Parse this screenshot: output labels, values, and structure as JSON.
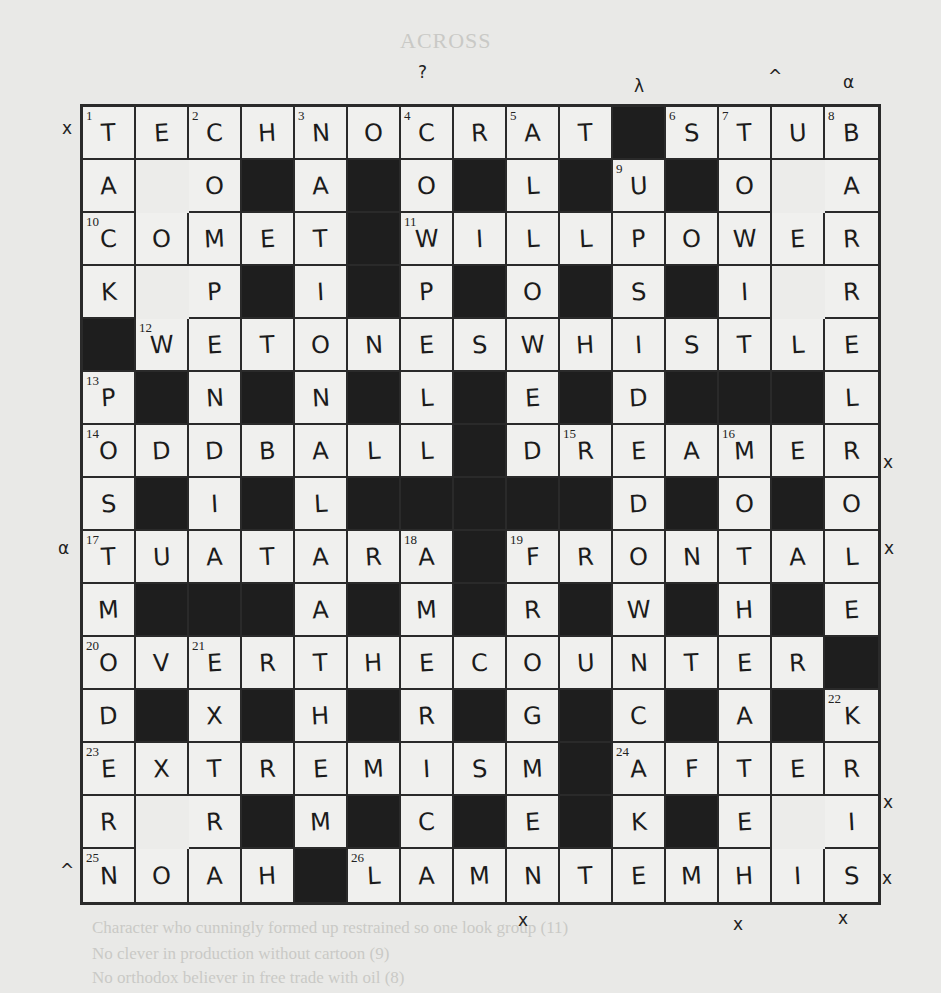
{
  "ghost_text": {
    "heading": "ACROSS",
    "lines": [
      "Character who cunningly formed up restrained so one look group (11)",
      "No clever in production without cartoon (9)",
      "No orthodox believer in free trade with oil (8)"
    ]
  },
  "grid": {
    "size": 15,
    "rows": [
      "TECHNOCRAT#STUB",
      "A_O#A#O#L#U#O_A",
      "COMET#WILLPOWER",
      "K_P#I#P#O#S#I_R",
      "#WETONESWHISTLE",
      "P#N#N#L#E#D###L",
      "ODDBALL#DREAMER",
      "S#I#L#####D#O#O",
      "TUATARA#FRONTAL",
      "M###A#M#R#W#H#E",
      "OVERTHECOUNTER#",
      "D#X#H#R#G#C#A#K",
      "EXTREMISM#AFTER",
      "R_R#M#C#E#K#E_I",
      "NOAH#LAMNTEMHIS"
    ],
    "numbers": [
      {
        "r": 0,
        "c": 0,
        "n": "1"
      },
      {
        "r": 0,
        "c": 2,
        "n": "2"
      },
      {
        "r": 0,
        "c": 4,
        "n": "3"
      },
      {
        "r": 0,
        "c": 6,
        "n": "4"
      },
      {
        "r": 0,
        "c": 8,
        "n": "5"
      },
      {
        "r": 0,
        "c": 11,
        "n": "6"
      },
      {
        "r": 0,
        "c": 12,
        "n": "7"
      },
      {
        "r": 0,
        "c": 14,
        "n": "8"
      },
      {
        "r": 1,
        "c": 10,
        "n": "9"
      },
      {
        "r": 2,
        "c": 0,
        "n": "10"
      },
      {
        "r": 2,
        "c": 6,
        "n": "11"
      },
      {
        "r": 4,
        "c": 1,
        "n": "12"
      },
      {
        "r": 5,
        "c": 0,
        "n": "13"
      },
      {
        "r": 6,
        "c": 0,
        "n": "14"
      },
      {
        "r": 6,
        "c": 9,
        "n": "15"
      },
      {
        "r": 6,
        "c": 12,
        "n": "16"
      },
      {
        "r": 8,
        "c": 0,
        "n": "17"
      },
      {
        "r": 8,
        "c": 6,
        "n": "18"
      },
      {
        "r": 8,
        "c": 8,
        "n": "19"
      },
      {
        "r": 10,
        "c": 0,
        "n": "20"
      },
      {
        "r": 10,
        "c": 2,
        "n": "21"
      },
      {
        "r": 11,
        "c": 14,
        "n": "22"
      },
      {
        "r": 12,
        "c": 0,
        "n": "23"
      },
      {
        "r": 12,
        "c": 10,
        "n": "24"
      },
      {
        "r": 14,
        "c": 0,
        "n": "25"
      },
      {
        "r": 14,
        "c": 5,
        "n": "26"
      }
    ]
  },
  "margin_marks": [
    {
      "x": 62,
      "y": 118,
      "t": "x"
    },
    {
      "x": 58,
      "y": 538,
      "t": "α"
    },
    {
      "x": 60,
      "y": 860,
      "t": "^"
    },
    {
      "x": 418,
      "y": 62,
      "t": "?"
    },
    {
      "x": 634,
      "y": 76,
      "t": "λ"
    },
    {
      "x": 768,
      "y": 66,
      "t": "^"
    },
    {
      "x": 843,
      "y": 72,
      "t": "α"
    },
    {
      "x": 883,
      "y": 452,
      "t": "x"
    },
    {
      "x": 884,
      "y": 538,
      "t": "x"
    },
    {
      "x": 883,
      "y": 792,
      "t": "x"
    },
    {
      "x": 882,
      "y": 868,
      "t": "x"
    },
    {
      "x": 518,
      "y": 910,
      "t": "x"
    },
    {
      "x": 733,
      "y": 914,
      "t": "x"
    },
    {
      "x": 838,
      "y": 908,
      "t": "x"
    }
  ]
}
